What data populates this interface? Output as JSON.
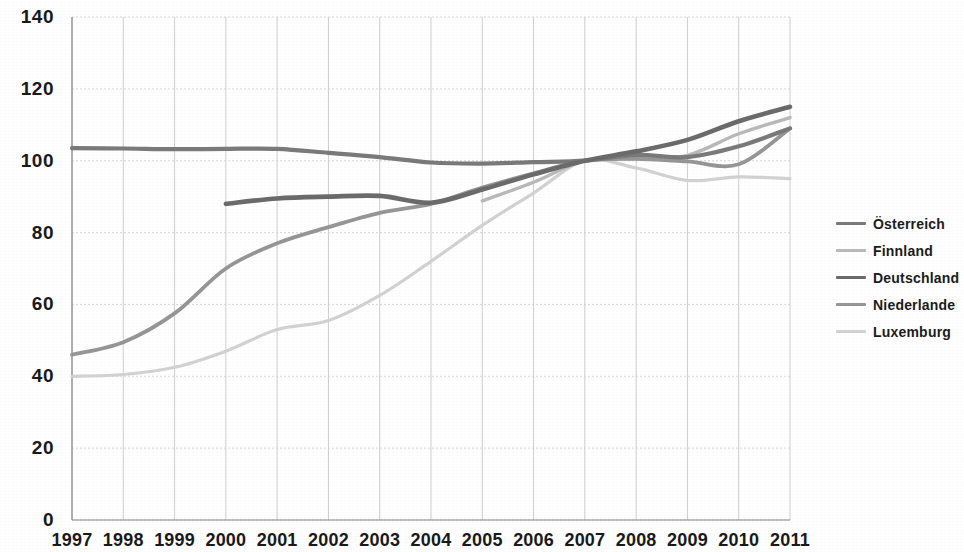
{
  "chart_data": {
    "type": "line",
    "title": "",
    "subtitle": "",
    "xlabel": "",
    "ylabel": "",
    "xlim": [
      1997,
      2011
    ],
    "ylim": [
      0,
      140
    ],
    "ytick_step": 20,
    "grid": true,
    "legend_position": "right",
    "index_base_year": 2007,
    "index_base_value": 100,
    "x": [
      1997,
      1998,
      1999,
      2000,
      2001,
      2002,
      2003,
      2004,
      2005,
      2006,
      2007,
      2008,
      2009,
      2010,
      2011
    ],
    "categories": [
      "1997",
      "1998",
      "1999",
      "2000",
      "2001",
      "2002",
      "2003",
      "2004",
      "2005",
      "2006",
      "2007",
      "2008",
      "2009",
      "2010",
      "2011"
    ],
    "ytick_labels": [
      "0",
      "20",
      "40",
      "60",
      "80",
      "100",
      "120",
      "140"
    ],
    "ytick_values": [
      0,
      20,
      40,
      60,
      80,
      100,
      120,
      140
    ],
    "series": [
      {
        "name": "Österreich",
        "color": "#7a7a7a",
        "width": 4.2,
        "values": [
          103.5,
          103.4,
          103.2,
          103.3,
          103.3,
          102.2,
          101.0,
          99.5,
          99.2,
          99.6,
          100.0,
          101.6,
          101.0,
          104.0,
          109.0
        ]
      },
      {
        "name": "Finnland",
        "color": "#b9b9b9",
        "width": 3.4,
        "values": [
          null,
          null,
          null,
          null,
          null,
          null,
          null,
          null,
          88.8,
          94.0,
          100.0,
          100.6,
          101.5,
          107.5,
          112.0
        ]
      },
      {
        "name": "Deutschland",
        "color": "#6b6b6b",
        "width": 4.6,
        "values": [
          null,
          null,
          null,
          88.0,
          89.5,
          90.0,
          90.2,
          88.3,
          92.0,
          96.2,
          100.0,
          102.6,
          105.8,
          111.0,
          115.0
        ]
      },
      {
        "name": "Niederlande",
        "color": "#969696",
        "width": 3.8,
        "values": [
          46.0,
          49.5,
          57.5,
          70.0,
          77.0,
          81.5,
          85.5,
          88.0,
          92.5,
          96.5,
          100.0,
          100.5,
          99.8,
          99.0,
          109.0
        ]
      },
      {
        "name": "Luxemburg",
        "color": "#d2d2d2",
        "width": 3.2,
        "values": [
          40.0,
          40.5,
          42.5,
          47.0,
          53.0,
          55.5,
          62.5,
          72.0,
          82.0,
          91.0,
          100.0,
          98.0,
          94.5,
          95.5,
          95.0
        ]
      }
    ]
  },
  "legend": {
    "items": [
      {
        "label": "Österreich"
      },
      {
        "label": "Finnland"
      },
      {
        "label": "Deutschland"
      },
      {
        "label": "Niederlande"
      },
      {
        "label": "Luxemburg"
      }
    ]
  }
}
